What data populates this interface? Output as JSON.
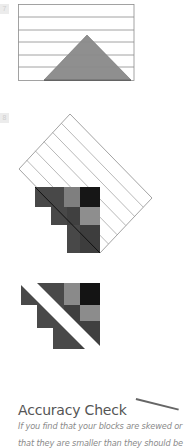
{
  "steps": [
    {
      "number": "7"
    },
    {
      "number": "8"
    }
  ],
  "colors": {
    "outline": "#8c8c8c",
    "triangle_fill": "#8f8f8f",
    "block_dark": "#4a4a4a",
    "block_darker": "#3c3c3c",
    "block_black": "#161616",
    "block_mid": "#7d7d7d",
    "block_light": "#8e8e8e"
  },
  "section": {
    "heading": "Accuracy Check",
    "body_lines": [
      "If you find that your blocks are skewed or",
      "that they are smaller than they should be"
    ]
  }
}
